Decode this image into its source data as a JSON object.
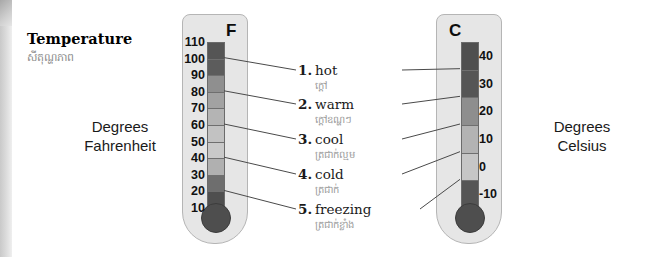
{
  "heading": {
    "title": "Temperature",
    "khmer": "សីតុណ្ហភាព"
  },
  "captions": {
    "fahrenheit": "Degrees\nFahrenheit",
    "celsius": "Degrees\nCelsius"
  },
  "thermometers": {
    "fahrenheit": {
      "letter": "F",
      "ticks": [
        "110",
        "100",
        "90",
        "80",
        "70",
        "60",
        "50",
        "40",
        "30",
        "20",
        "10"
      ],
      "band_colors": [
        "#555555",
        "#5c5c5c",
        "#8f8f8f",
        "#a2a2a2",
        "#b4b4b4",
        "#c2c2c2",
        "#c9c9c9",
        "#b0b0b0",
        "#6e6e6e",
        "#4f4f4f"
      ],
      "bulb_color": "#4e4e4e"
    },
    "celsius": {
      "letter": "C",
      "ticks": [
        "40",
        "30",
        "20",
        "10",
        "0",
        "-10"
      ],
      "band_colors": [
        "#4f4f4f",
        "#555555",
        "#8e8e8e",
        "#b3b3b3",
        "#c6c6c6",
        "#555555"
      ],
      "bulb_color": "#4e4e4e"
    }
  },
  "labels": [
    {
      "num": "1.",
      "word": "hot",
      "khmer": "ក្ដៅ"
    },
    {
      "num": "2.",
      "word": "warm",
      "khmer": "ក្ដៅឧណ្ហៗ"
    },
    {
      "num": "3.",
      "word": "cool",
      "khmer": "ត្រជាក់ល្មម"
    },
    {
      "num": "4.",
      "word": "cold",
      "khmer": "ត្រជាក់"
    },
    {
      "num": "5.",
      "word": "freezing",
      "khmer": "ត្រជាក់ខ្លាំង"
    }
  ],
  "colors": {
    "line": "#4a4a4a",
    "thermo_body": "#e6e6e6",
    "thermo_border": "#b5b5b5",
    "khmer_text": "#9a9a9a"
  }
}
